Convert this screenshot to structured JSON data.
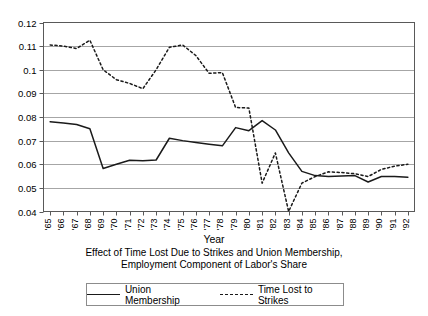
{
  "chart_data": {
    "type": "line",
    "title": "",
    "xlabel": "Year",
    "ylabel": "",
    "ylim": [
      0.04,
      0.12
    ],
    "ytick_values": [
      0.04,
      0.05,
      0.06,
      0.07,
      0.08,
      0.09,
      0.1,
      0.11,
      0.12
    ],
    "ytick_labels": [
      "0.04",
      "0.05",
      "0.06",
      "0.07",
      "0.08",
      "0.09",
      "0.1",
      "0.11",
      "0.12"
    ],
    "grid": true,
    "grid_axis": "y",
    "legend_position": "bottom",
    "categories": [
      "'65",
      "'66",
      "'67",
      "'68",
      "'69",
      "'70",
      "'71",
      "'72",
      "'73",
      "'74",
      "'75",
      "'76",
      "'77",
      "'78",
      "'79",
      "'80",
      "'81",
      "'82",
      "'83",
      "'84",
      "'85",
      "'86",
      "'87",
      "'88",
      "'89",
      "'90",
      "'91",
      "'92"
    ],
    "x": [
      1965,
      1966,
      1967,
      1968,
      1969,
      1970,
      1971,
      1972,
      1973,
      1974,
      1975,
      1976,
      1977,
      1978,
      1979,
      1980,
      1981,
      1982,
      1983,
      1984,
      1985,
      1986,
      1987,
      1988,
      1989,
      1990,
      1991,
      1992
    ],
    "series": [
      {
        "name": "Union Membership",
        "style": "solid",
        "color": "#1a1a1a",
        "values": [
          0.078,
          0.0775,
          0.0768,
          0.075,
          0.0582,
          0.06,
          0.0617,
          0.0615,
          0.0618,
          0.071,
          0.07,
          0.0692,
          0.0685,
          0.0678,
          0.0755,
          0.0742,
          0.0785,
          0.0745,
          0.0648,
          0.057,
          0.0552,
          0.0548,
          0.055,
          0.0552,
          0.0525,
          0.0548,
          0.0548,
          0.0545
        ]
      },
      {
        "name": "Time Lost to Strikes",
        "style": "dotted",
        "color": "#1a1a1a",
        "values": [
          0.1105,
          0.11,
          0.109,
          0.1125,
          0.1,
          0.0958,
          0.0942,
          0.092,
          0.1,
          0.1095,
          0.1105,
          0.106,
          0.0985,
          0.0988,
          0.084,
          0.0838,
          0.052,
          0.0648,
          0.04,
          0.052,
          0.0548,
          0.0568,
          0.0565,
          0.056,
          0.0548,
          0.0578,
          0.0592,
          0.06
        ]
      }
    ]
  },
  "axis": {
    "x_title": "Year"
  },
  "caption": {
    "line1": "Effect of Time Lost Due to Strikes and Union Membership,",
    "line2": "Employment Component of Labor's Share"
  },
  "legend": {
    "items": [
      {
        "label": "Union Membership",
        "style": "solid"
      },
      {
        "label": "Time Lost to Strikes",
        "style": "dotted"
      }
    ]
  }
}
